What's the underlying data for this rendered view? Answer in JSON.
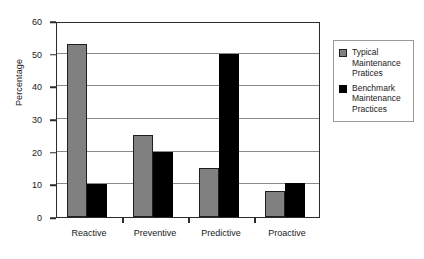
{
  "chart_data": {
    "type": "bar",
    "title": "",
    "xlabel": "",
    "ylabel": "Percentage",
    "ylim": [
      0,
      60
    ],
    "ytick_step": 10,
    "yticks": [
      0,
      10,
      20,
      30,
      40,
      50,
      60
    ],
    "ytick_labels": [
      "0",
      "10",
      "20",
      "30",
      "40",
      "50",
      "60"
    ],
    "grid": true,
    "legend_position": "right",
    "categories": [
      "Reactive",
      "Preventive",
      "Predictive",
      "Proactive"
    ],
    "series": [
      {
        "name": "Typical Maintenance Pratices",
        "color": "#808080",
        "values": [
          53,
          25,
          15,
          8
        ]
      },
      {
        "name": "Benchmark Maintenance Practices",
        "color": "#000000",
        "values": [
          10,
          20,
          50,
          10.5
        ]
      }
    ]
  },
  "legend": {
    "entries": [
      {
        "swatch": "gray-swatch",
        "line1": "Typical",
        "line2": "Maintenance",
        "line3": "Pratices"
      },
      {
        "swatch": "black-swatch",
        "line1": "Benchmark",
        "line2": "Maintenance",
        "line3": "Practices"
      }
    ]
  }
}
